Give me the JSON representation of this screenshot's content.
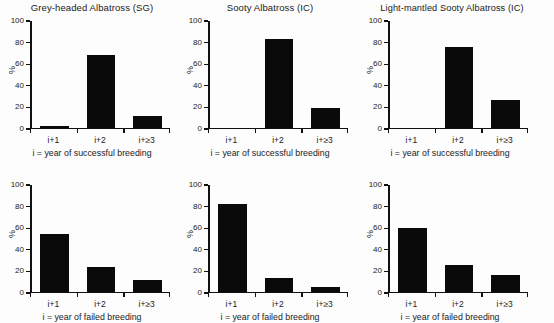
{
  "figure": {
    "background": "#fdfdfd",
    "bar_color": "#0a0a0a",
    "axis_color": "#111111"
  },
  "axis": {
    "ylabel": "%",
    "yticks": [
      0,
      20,
      40,
      60,
      80,
      100
    ],
    "ytick_labels": [
      "0",
      "20",
      "40",
      "60",
      "80",
      "100"
    ],
    "ylim": [
      0,
      100
    ],
    "categories": [
      "i+1",
      "i+2",
      "i+≥3"
    ],
    "xlabel_successful": "i = year of successful breeding",
    "xlabel_failed": "i = year of failed breeding"
  },
  "panels": [
    {
      "id": "grey-headed-albatross-sg-successful",
      "title": "Grey-headed Albatross (SG)",
      "xlabel": "i = year of successful breeding",
      "values": [
        1,
        68,
        11
      ]
    },
    {
      "id": "sooty-albatross-ic-successful",
      "title": "Sooty Albatross (IC)",
      "xlabel": "i = year of successful breeding",
      "values": [
        0,
        83,
        18
      ]
    },
    {
      "id": "light-mantled-sooty-albatross-ic-successful",
      "title": "Light-mantled Sooty Albatross (IC)",
      "xlabel": "i = year of successful breeding",
      "values": [
        0,
        75,
        26
      ]
    },
    {
      "id": "grey-headed-albatross-sg-failed",
      "title": "",
      "xlabel": "i = year of failed breeding",
      "values": [
        54,
        23,
        11
      ]
    },
    {
      "id": "sooty-albatross-ic-failed",
      "title": "",
      "xlabel": "i = year of failed breeding",
      "values": [
        82,
        13,
        4
      ]
    },
    {
      "id": "light-mantled-sooty-albatross-ic-failed",
      "title": "",
      "xlabel": "i = year of failed breeding",
      "values": [
        59,
        25,
        15
      ]
    }
  ],
  "chart_data": [
    {
      "type": "bar",
      "title": "Grey-headed Albatross (SG)",
      "categories": [
        "i+1",
        "i+2",
        "i+≥3"
      ],
      "values": [
        1,
        68,
        11
      ],
      "xlabel": "i = year of successful breeding",
      "ylabel": "%",
      "ylim": [
        0,
        100
      ],
      "yticks": [
        0,
        20,
        40,
        60,
        80,
        100
      ],
      "grid": false,
      "legend": "none"
    },
    {
      "type": "bar",
      "title": "Sooty Albatross (IC)",
      "categories": [
        "i+1",
        "i+2",
        "i+≥3"
      ],
      "values": [
        0,
        83,
        18
      ],
      "xlabel": "i = year of successful breeding",
      "ylabel": "%",
      "ylim": [
        0,
        100
      ],
      "yticks": [
        0,
        20,
        40,
        60,
        80,
        100
      ],
      "grid": false,
      "legend": "none"
    },
    {
      "type": "bar",
      "title": "Light-mantled Sooty Albatross (IC)",
      "categories": [
        "i+1",
        "i+2",
        "i+≥3"
      ],
      "values": [
        0,
        75,
        26
      ],
      "xlabel": "i = year of successful breeding",
      "ylabel": "%",
      "ylim": [
        0,
        100
      ],
      "yticks": [
        0,
        20,
        40,
        60,
        80,
        100
      ],
      "grid": false,
      "legend": "none"
    },
    {
      "type": "bar",
      "title": "",
      "categories": [
        "i+1",
        "i+2",
        "i+≥3"
      ],
      "values": [
        54,
        23,
        11
      ],
      "xlabel": "i = year of failed breeding",
      "ylabel": "%",
      "ylim": [
        0,
        100
      ],
      "yticks": [
        0,
        20,
        40,
        60,
        80,
        100
      ],
      "grid": false,
      "legend": "none"
    },
    {
      "type": "bar",
      "title": "",
      "categories": [
        "i+1",
        "i+2",
        "i+≥3"
      ],
      "values": [
        82,
        13,
        4
      ],
      "xlabel": "i = year of failed breeding",
      "ylabel": "%",
      "ylim": [
        0,
        100
      ],
      "yticks": [
        0,
        20,
        40,
        60,
        80,
        100
      ],
      "grid": false,
      "legend": "none"
    },
    {
      "type": "bar",
      "title": "",
      "categories": [
        "i+1",
        "i+2",
        "i+≥3"
      ],
      "values": [
        59,
        25,
        15
      ],
      "xlabel": "i = year of failed breeding",
      "ylabel": "%",
      "ylim": [
        0,
        100
      ],
      "yticks": [
        0,
        20,
        40,
        60,
        80,
        100
      ],
      "grid": false,
      "legend": "none"
    }
  ]
}
